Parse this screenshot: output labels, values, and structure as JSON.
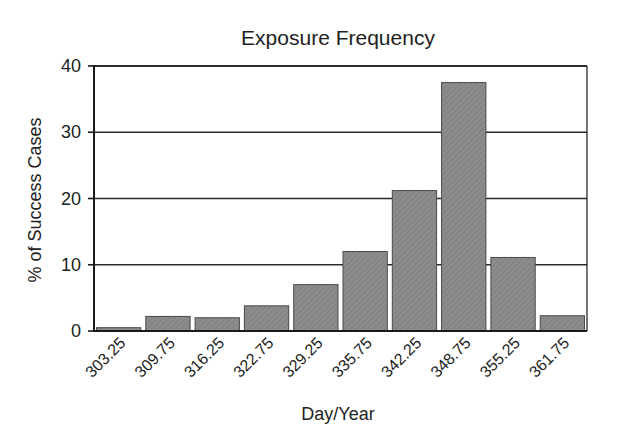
{
  "chart_data": {
    "type": "bar",
    "title": "Exposure Frequency",
    "xlabel": "Day/Year",
    "ylabel": "% of Success Cases",
    "categories": [
      "303.25",
      "309.75",
      "316.25",
      "322.75",
      "329.25",
      "335.75",
      "342.25",
      "348.75",
      "355.25",
      "361.75"
    ],
    "values": [
      0.5,
      2.2,
      2.0,
      3.8,
      7.0,
      12.0,
      21.2,
      37.5,
      11.1,
      2.3
    ],
    "ylim": [
      0,
      40
    ],
    "yticks": [
      0,
      10,
      20,
      30,
      40
    ],
    "grid": true,
    "legend": null,
    "xtick_rotation": -45,
    "colors": {
      "bar_fill": "#8c8c8c",
      "bar_edge": "#4a4a4a",
      "axis": "#1a1a1a",
      "grid": "#2a2a2a"
    }
  }
}
